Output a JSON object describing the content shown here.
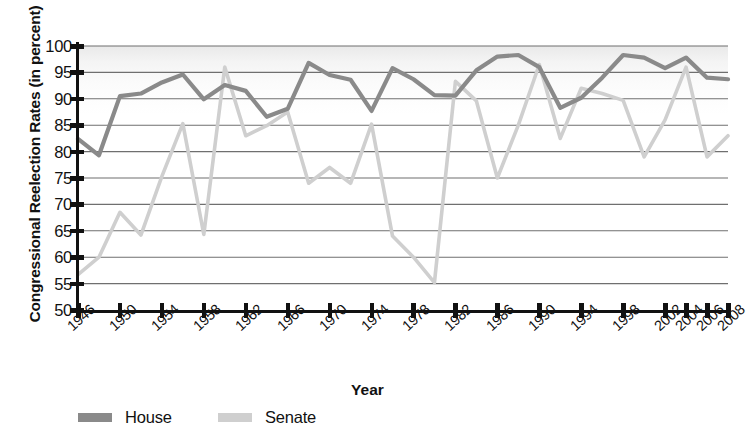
{
  "chart_data": {
    "type": "line",
    "title": "",
    "xlabel": "Year",
    "ylabel": "Congressional Reelection Rates (in percent)",
    "ylim": [
      50,
      100
    ],
    "ytick_values": [
      50,
      55,
      60,
      65,
      70,
      75,
      80,
      85,
      90,
      95,
      100
    ],
    "grid": true,
    "legend_position": "bottom-left",
    "x": [
      1946,
      1948,
      1950,
      1952,
      1954,
      1956,
      1958,
      1960,
      1962,
      1964,
      1966,
      1968,
      1970,
      1972,
      1974,
      1976,
      1978,
      1980,
      1982,
      1984,
      1986,
      1988,
      1990,
      1992,
      1994,
      1996,
      1998,
      2000,
      2002,
      2004,
      2006,
      2008
    ],
    "xtick_labels": [
      "1946",
      "1950",
      "1954",
      "1958",
      "1962",
      "1966",
      "1970",
      "1974",
      "1978",
      "1982",
      "1986",
      "1990",
      "1994",
      "1998",
      "2002",
      "2004",
      "2006",
      "2008"
    ],
    "xtick_positions": [
      1946,
      1950,
      1954,
      1958,
      1962,
      1966,
      1970,
      1974,
      1978,
      1982,
      1986,
      1990,
      1994,
      1998,
      2002,
      2004,
      2006,
      2008
    ],
    "series": [
      {
        "name": "House",
        "color": "#8a8a8a",
        "values": [
          82.4,
          79.3,
          90.5,
          91.0,
          93.1,
          94.6,
          89.9,
          92.6,
          91.5,
          86.6,
          88.1,
          96.8,
          94.5,
          93.6,
          87.7,
          95.8,
          93.7,
          90.7,
          90.6,
          95.4,
          98.0,
          98.3,
          96.0,
          88.3,
          90.2,
          94.0,
          98.3,
          97.8,
          95.8,
          97.8,
          94.0,
          93.7
        ]
      },
      {
        "name": "Senate",
        "color": "#cfcfcf",
        "values": [
          56.7,
          60.0,
          68.5,
          64.2,
          75.3,
          85.3,
          64.3,
          96.0,
          83.0,
          84.9,
          87.5,
          74.0,
          77.0,
          74.0,
          85.2,
          64.0,
          60.0,
          55.2,
          93.3,
          89.6,
          75.0,
          85.0,
          96.5,
          82.5,
          92.0,
          91.0,
          89.7,
          79.0,
          86.0,
          96.0,
          79.0,
          83.0
        ]
      }
    ]
  },
  "axes": {
    "y_title": "Congressional Reelection Rates (in percent)",
    "x_title": "Year"
  },
  "legend": {
    "items": [
      {
        "label": "House",
        "color": "#8a8a8a"
      },
      {
        "label": "Senate",
        "color": "#cfcfcf"
      }
    ]
  }
}
